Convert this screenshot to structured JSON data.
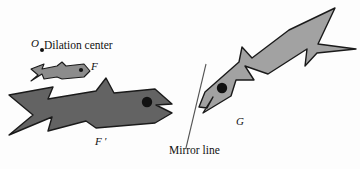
{
  "figure": {
    "type": "geometry-diagram",
    "background_color": "#fdfdfd",
    "labels": {
      "dilation_center_point": "O",
      "dilation_center_text": "Dilation center",
      "small_fish": "F",
      "large_fish": "F ′",
      "mirrored_fish": "G",
      "mirror_line": "Mirror line"
    },
    "shapes": {
      "small_fish": {
        "name": "F",
        "fill": "#8c8c8c",
        "stroke": "#1a1a1a",
        "description": "small light-gray fish pointing right"
      },
      "large_fish": {
        "name": "F'",
        "fill": "#636363",
        "stroke": "#1a1a1a",
        "description": "large dark-gray fish pointing right, dilation image of F"
      },
      "mirrored_fish": {
        "name": "G",
        "fill": "#a2a2a2",
        "stroke": "#1a1a1a",
        "description": "medium-gray fish pointing down-left, reflection across mirror line"
      },
      "dilation_center_dot": {
        "fill": "#111111"
      },
      "mirror_line": {
        "stroke": "#555555"
      }
    }
  }
}
